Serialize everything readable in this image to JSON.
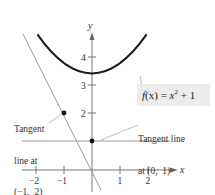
{
  "figure": {
    "axes": {
      "x_label": "x",
      "y_label": "y",
      "x_ticks": [
        "−2",
        "−1",
        "1",
        "2"
      ],
      "y_ticks": [
        "2",
        "3",
        "4"
      ]
    },
    "function_label": {
      "prefix": "f",
      "arg": "(x)",
      "equals": " = ",
      "var": "x",
      "exp": "2",
      "rest": " + 1"
    },
    "annotations": {
      "left_line1": "Tangent",
      "left_line2": "line at",
      "left_line3": "(−1,  2)",
      "right_line1": "Tangent line",
      "right_line2": "at (0,  1)"
    },
    "colors": {
      "curve": "#1a1a1a",
      "tangent": "#9a9a9a",
      "axis": "#666666",
      "label_box": "#ececec"
    }
  }
}
